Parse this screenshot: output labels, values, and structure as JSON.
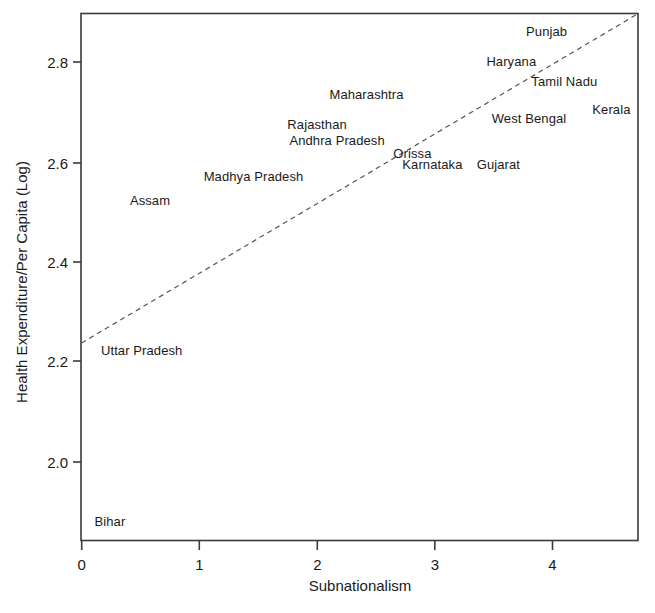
{
  "chart_data": {
    "type": "scatter",
    "title": "",
    "xlabel": "Subnationalism",
    "ylabel": "Health Expenditure/Per Capita (Log)",
    "xlim": [
      -0.005,
      4.73
    ],
    "ylim": [
      1.9,
      2.895
    ],
    "grid": false,
    "legend": null,
    "xticks": [
      "0",
      "1",
      "2",
      "3",
      "4"
    ],
    "xtick_values": [
      0,
      1,
      2,
      3,
      4
    ],
    "yticks": [
      "2.8",
      "2.6",
      "2.4",
      "2.2",
      "2.0"
    ],
    "ytick_values": [
      2.8,
      2.6,
      2.4,
      2.2,
      2.0
    ],
    "point_style": "text-label-only",
    "points": [
      {
        "label": "Punjab",
        "x": 3.95,
        "y": 2.862
      },
      {
        "label": "Haryana",
        "x": 3.65,
        "y": 2.803
      },
      {
        "label": "Tamil Nadu",
        "x": 4.1,
        "y": 2.763
      },
      {
        "label": "Kerala",
        "x": 4.5,
        "y": 2.706
      },
      {
        "label": "West Bengal",
        "x": 3.8,
        "y": 2.687
      },
      {
        "label": "Maharashtra",
        "x": 2.42,
        "y": 2.736
      },
      {
        "label": "Rajasthan",
        "x": 2.0,
        "y": 2.676
      },
      {
        "label": "Andhra Pradesh",
        "x": 2.17,
        "y": 2.644
      },
      {
        "label": "Orissa",
        "x": 2.81,
        "y": 2.618
      },
      {
        "label": "Karnataka",
        "x": 2.98,
        "y": 2.596
      },
      {
        "label": "Gujarat",
        "x": 3.54,
        "y": 2.596
      },
      {
        "label": "Madhya Pradesh",
        "x": 1.46,
        "y": 2.571
      },
      {
        "label": "Assam",
        "x": 0.58,
        "y": 2.524
      },
      {
        "label": "Uttar Pradesh",
        "x": 0.51,
        "y": 2.222
      },
      {
        "label": "Bihar",
        "x": 0.24,
        "y": 1.881
      }
    ],
    "fit_line": {
      "style": "dashed",
      "x_start": 0.0,
      "y_start": 2.236,
      "x_end": 4.73,
      "y_end": 2.895
    },
    "colors": {
      "axis": "#3a3a3a",
      "text": "#1a1a1a",
      "fit_line": "#555555",
      "background": "#ffffff"
    }
  }
}
